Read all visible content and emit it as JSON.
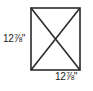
{
  "figure": {
    "type": "square-with-diagonals",
    "background_color": "#ffffff",
    "line_color": "#2b2b2b",
    "text_color": "#1a1a1a",
    "square": {
      "left": 31,
      "top": 8,
      "right": 80,
      "bottom": 70,
      "stroke_width": 1.6
    },
    "diagonals": {
      "stroke_width": 1.6,
      "count": 2,
      "intersection": {
        "x": 55.5,
        "y": 39
      }
    },
    "labels": {
      "height": {
        "text": "12⅞\"",
        "value": "12 7/8",
        "unit": "inches",
        "position": "left"
      },
      "width": {
        "text": "12⅞\"",
        "value": "12 7/8",
        "unit": "inches",
        "position": "bottom"
      }
    }
  }
}
